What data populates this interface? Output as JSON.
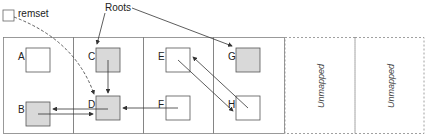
{
  "legend": {
    "remset_label": "remset",
    "roots_label": "Roots"
  },
  "regions": [
    {
      "id": "r1",
      "mapped": true
    },
    {
      "id": "r2",
      "mapped": true
    },
    {
      "id": "r3",
      "mapped": true
    },
    {
      "id": "r4",
      "mapped": true
    },
    {
      "id": "r5",
      "mapped": false,
      "label": "Unmapped"
    },
    {
      "id": "r6",
      "mapped": false,
      "label": "Unmapped"
    }
  ],
  "objects": [
    {
      "name": "A",
      "region": 1,
      "shaded": false
    },
    {
      "name": "B",
      "region": 1,
      "shaded": true
    },
    {
      "name": "C",
      "region": 2,
      "shaded": true
    },
    {
      "name": "D",
      "region": 2,
      "shaded": true
    },
    {
      "name": "E",
      "region": 3,
      "shaded": false
    },
    {
      "name": "F",
      "region": 3,
      "shaded": false
    },
    {
      "name": "G",
      "region": 4,
      "shaded": true
    },
    {
      "name": "H",
      "region": 4,
      "shaded": false
    }
  ],
  "edges": [
    {
      "from": "Roots",
      "to": "C"
    },
    {
      "from": "Roots",
      "to": "G"
    },
    {
      "from": "remset",
      "to": "D",
      "style": "dashed"
    },
    {
      "from": "C",
      "to": "D"
    },
    {
      "from": "B",
      "to": "D"
    },
    {
      "from": "D",
      "to": "B"
    },
    {
      "from": "F",
      "to": "D"
    },
    {
      "from": "E",
      "to": "H"
    },
    {
      "from": "H",
      "to": "E"
    }
  ],
  "colors": {
    "shaded_fill": "#d9d9d9",
    "stroke": "#555555",
    "border": "#808080"
  }
}
